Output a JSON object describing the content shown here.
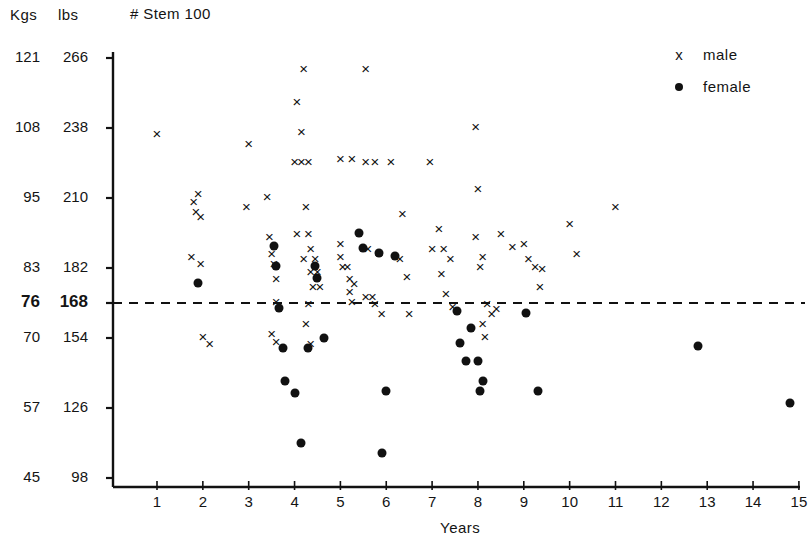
{
  "header": {
    "kgs_label": "Kgs",
    "lbs_label": "lbs",
    "stem_label": "#  Stem  100"
  },
  "legend": {
    "male_marker": "x",
    "male_label": "male",
    "female_marker": "dot",
    "female_label": "female"
  },
  "axis": {
    "x_title": "Years",
    "y_kgs_ticks": [
      "121",
      "108",
      "95",
      "83",
      "76",
      "70",
      "57",
      "45"
    ],
    "y_lbs_ticks": [
      "266",
      "238",
      "210",
      "182",
      "168",
      "154",
      "126",
      "98"
    ],
    "x_ticks": [
      "1",
      "2",
      "3",
      "4",
      "5",
      "6",
      "7",
      "8",
      "9",
      "10",
      "11",
      "12",
      "13",
      "14",
      "15"
    ]
  },
  "colors": {
    "ink": "#111111",
    "background": "#ffffff"
  },
  "chart_data": {
    "type": "scatter",
    "title": "#  Stem  100",
    "xlabel": "Years",
    "ylabel": "Kgs / lbs",
    "xlim": [
      0,
      15.6
    ],
    "ylim_kgs": [
      41,
      124
    ],
    "ylim_lbs": [
      90,
      272
    ],
    "grid": false,
    "legend_position": "top-right",
    "reference_line": {
      "kgs": 76,
      "lbs": 168,
      "style": "dashed",
      "orientation": "horizontal"
    },
    "y_axis_kgs_ticks": [
      121,
      108,
      95,
      83,
      76,
      70,
      57,
      45
    ],
    "y_axis_lbs_ticks": [
      266,
      238,
      210,
      182,
      168,
      154,
      126,
      98
    ],
    "x_axis_ticks": [
      1,
      2,
      3,
      4,
      5,
      6,
      7,
      8,
      9,
      10,
      11,
      12,
      13,
      14,
      15
    ],
    "series": [
      {
        "name": "male",
        "marker": "x",
        "points": [
          [
            1.0,
            236
          ],
          [
            1.8,
            209
          ],
          [
            1.85,
            205
          ],
          [
            1.95,
            203
          ],
          [
            1.75,
            187
          ],
          [
            1.95,
            184
          ],
          [
            1.9,
            212
          ],
          [
            2.0,
            155
          ],
          [
            2.15,
            152
          ],
          [
            3.0,
            232
          ],
          [
            2.95,
            207
          ],
          [
            3.4,
            211
          ],
          [
            3.45,
            195
          ],
          [
            3.5,
            188
          ],
          [
            3.55,
            184
          ],
          [
            3.6,
            178
          ],
          [
            3.6,
            169
          ],
          [
            3.5,
            156
          ],
          [
            3.6,
            153
          ],
          [
            4.05,
            249
          ],
          [
            4.2,
            262
          ],
          [
            4.15,
            237
          ],
          [
            4.0,
            225
          ],
          [
            4.15,
            225
          ],
          [
            4.3,
            225
          ],
          [
            4.05,
            196
          ],
          [
            4.25,
            207
          ],
          [
            4.3,
            196
          ],
          [
            4.35,
            190
          ],
          [
            4.2,
            186
          ],
          [
            4.45,
            186
          ],
          [
            4.35,
            181
          ],
          [
            4.5,
            181
          ],
          [
            4.4,
            175
          ],
          [
            4.55,
            175
          ],
          [
            4.3,
            168
          ],
          [
            4.25,
            160
          ],
          [
            4.35,
            152
          ],
          [
            5.0,
            226
          ],
          [
            5.25,
            226
          ],
          [
            5.0,
            192
          ],
          [
            5.0,
            187
          ],
          [
            5.05,
            183
          ],
          [
            5.15,
            183
          ],
          [
            5.2,
            178
          ],
          [
            5.2,
            173
          ],
          [
            5.3,
            176
          ],
          [
            5.25,
            169
          ],
          [
            5.55,
            262
          ],
          [
            5.55,
            225
          ],
          [
            5.75,
            225
          ],
          [
            5.6,
            190
          ],
          [
            5.55,
            171
          ],
          [
            5.7,
            171
          ],
          [
            5.75,
            168
          ],
          [
            5.9,
            164
          ],
          [
            6.1,
            225
          ],
          [
            6.35,
            204
          ],
          [
            6.3,
            186
          ],
          [
            6.45,
            179
          ],
          [
            6.5,
            164
          ],
          [
            6.95,
            225
          ],
          [
            7.0,
            190
          ],
          [
            7.15,
            198
          ],
          [
            7.25,
            190
          ],
          [
            7.2,
            180
          ],
          [
            7.3,
            172
          ],
          [
            7.4,
            186
          ],
          [
            7.45,
            167
          ],
          [
            7.95,
            239
          ],
          [
            8.0,
            214
          ],
          [
            7.95,
            195
          ],
          [
            8.1,
            187
          ],
          [
            8.05,
            183
          ],
          [
            8.2,
            168
          ],
          [
            8.1,
            160
          ],
          [
            8.15,
            155
          ],
          [
            8.3,
            164
          ],
          [
            8.4,
            166
          ],
          [
            8.5,
            196
          ],
          [
            8.75,
            191
          ],
          [
            9.0,
            192
          ],
          [
            9.1,
            186
          ],
          [
            9.25,
            183
          ],
          [
            9.35,
            175
          ],
          [
            9.4,
            182
          ],
          [
            10.0,
            200
          ],
          [
            10.15,
            188
          ],
          [
            11.0,
            207
          ]
        ]
      },
      {
        "name": "female",
        "marker": "dot",
        "points": [
          [
            1.9,
            176
          ],
          [
            3.55,
            191
          ],
          [
            3.6,
            183
          ],
          [
            3.65,
            166
          ],
          [
            3.75,
            150
          ],
          [
            3.8,
            137
          ],
          [
            4.0,
            132
          ],
          [
            4.15,
            112
          ],
          [
            4.3,
            150
          ],
          [
            4.45,
            183
          ],
          [
            4.5,
            178
          ],
          [
            4.65,
            154
          ],
          [
            5.4,
            196
          ],
          [
            5.5,
            190
          ],
          [
            5.9,
            108
          ],
          [
            6.0,
            133
          ],
          [
            5.85,
            188
          ],
          [
            6.2,
            187
          ],
          [
            7.55,
            165
          ],
          [
            7.6,
            152
          ],
          [
            7.75,
            145
          ],
          [
            7.85,
            158
          ],
          [
            8.0,
            145
          ],
          [
            8.05,
            133
          ],
          [
            8.1,
            137
          ],
          [
            9.05,
            164
          ],
          [
            9.3,
            133
          ],
          [
            12.8,
            151
          ],
          [
            14.8,
            128
          ]
        ]
      }
    ]
  }
}
